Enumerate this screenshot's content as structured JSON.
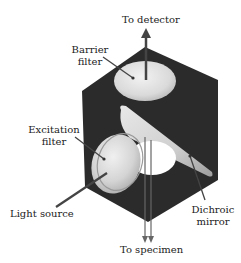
{
  "diagram": {
    "labels": {
      "to_detector": "To detector",
      "barrier_filter_line1": "Barrier",
      "barrier_filter_line2": "filter",
      "excitation_filter_line1": "Excitation",
      "excitation_filter_line2": "filter",
      "light_source": "Light source",
      "dichroic_mirror_line1": "Dichroic",
      "dichroic_mirror_line2": "mirror",
      "to_specimen": "To specimen"
    },
    "components": [
      "cube-housing",
      "barrier-filter",
      "dichroic-mirror",
      "excitation-filter",
      "specimen-port",
      "detector-arrow",
      "specimen-beam"
    ],
    "colors": {
      "housing": "#2a2a2a",
      "filter_light": "#e6e6e6",
      "filter_shade": "#bdbdbd",
      "arrow": "#444444",
      "text": "#222222"
    }
  }
}
